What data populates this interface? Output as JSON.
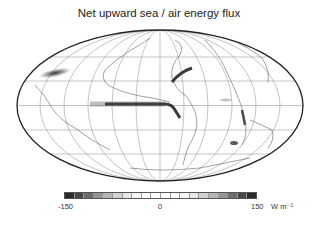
{
  "title": "Net upward sea / air energy flux",
  "projection": "Mollweide (Hammer-Aitoff style) world map",
  "colorbar": {
    "min_label": "-150",
    "mid_label": "0",
    "max_label": "150",
    "units": "W m⁻²",
    "colors": [
      "#2b2b2b",
      "#474747",
      "#6e6e6e",
      "#959595",
      "#b5b5b5",
      "#d2d2d2",
      "#e8e8e8",
      "#f6f6f6",
      "#ffffff",
      "#ffffff",
      "#ffffff",
      "#ffffff",
      "#f6f6f6",
      "#e8e8e8",
      "#d2d2d2",
      "#b5b5b5",
      "#959595",
      "#6e6e6e",
      "#474747",
      "#2b2b2b"
    ]
  },
  "features": [
    {
      "name": "equatorial-pacific-band",
      "description": "dark negative band along equator, eastern Pacific"
    },
    {
      "name": "kuroshio",
      "description": "dark streak off Japan"
    },
    {
      "name": "gulf-stream",
      "description": "dark streak off eastern North America"
    },
    {
      "name": "benguela",
      "description": "dark streak off southwest Africa"
    }
  ]
}
